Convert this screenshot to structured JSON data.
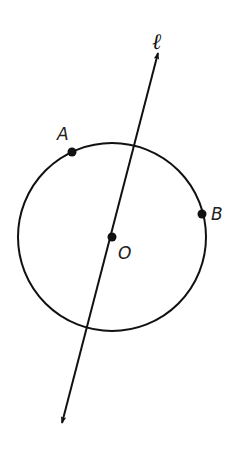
{
  "figure": {
    "type": "geometry",
    "stroke_color": "#111111",
    "background": "#ffffff",
    "circle": {
      "center_label": "O",
      "cx": 112,
      "cy": 237,
      "r": 94
    },
    "line": {
      "label": "ℓ",
      "x1": 158,
      "y1": 53,
      "x2": 62,
      "y2": 423,
      "arrows": "both"
    },
    "points": [
      {
        "name": "A",
        "label": "A",
        "x": 72,
        "y": 152,
        "label_x": 62,
        "label_y": 140
      },
      {
        "name": "B",
        "label": "B",
        "x": 202,
        "y": 214,
        "label_x": 212,
        "label_y": 220
      },
      {
        "name": "O",
        "label": "O",
        "x": 112,
        "y": 237,
        "label_x": 118,
        "label_y": 258
      }
    ],
    "line_label_pos": {
      "x": 156,
      "y": 48
    }
  }
}
